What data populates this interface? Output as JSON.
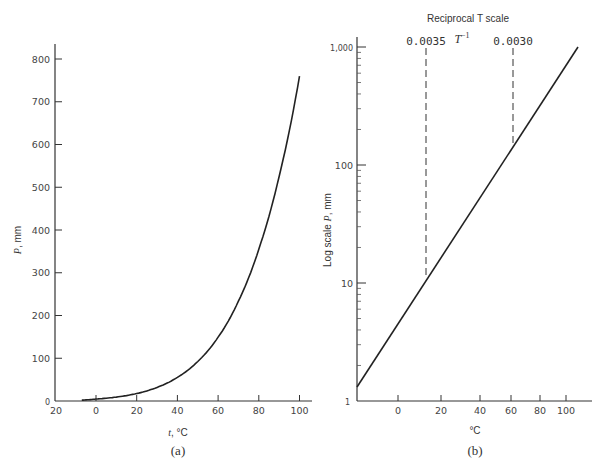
{
  "chart_data": [
    {
      "id": "a",
      "type": "line",
      "caption": "(a)",
      "title": "",
      "xlabel_var": "t",
      "xlabel_unit": ", °C",
      "ylabel_var": "P",
      "ylabel_unit": ", mm",
      "x_ticks": [
        "20",
        "0",
        "20",
        "40",
        "60",
        "80",
        "100"
      ],
      "x_tick_values": [
        -20,
        0,
        20,
        40,
        60,
        80,
        100
      ],
      "y_ticks": [
        "0",
        "100",
        "200",
        "300",
        "400",
        "500",
        "600",
        "700",
        "800"
      ],
      "xlim": [
        -20,
        105
      ],
      "ylim": [
        0,
        850
      ],
      "grid": false,
      "series": [
        {
          "name": "Vapor pressure",
          "x": [
            -7,
            0,
            10,
            20,
            30,
            40,
            50,
            60,
            70,
            80,
            90,
            100
          ],
          "y": [
            2,
            4.6,
            9.2,
            17.5,
            31.8,
            55.3,
            92.5,
            149.4,
            233.7,
            355.1,
            525.8,
            760
          ]
        }
      ]
    },
    {
      "id": "b",
      "type": "line",
      "caption": "(b)",
      "title": "Reciprocal T scale",
      "top_axis_label": "T",
      "top_axis_superscript": "−1",
      "top_ticks": [
        "0.0035",
        "0.0030"
      ],
      "xlabel": "°C",
      "ylabel_prefix": "Log scale ",
      "ylabel_var": "P",
      "ylabel_unit": ", mm",
      "y_scale": "log",
      "y_ticks": [
        "1",
        "10",
        "100",
        "1,000"
      ],
      "x_ticks": [
        "0",
        "20",
        "40",
        "60",
        "80",
        "100"
      ],
      "x_scale": "reciprocal_T",
      "ylim": [
        1,
        1000
      ],
      "grid": false,
      "series": [
        {
          "name": "log P vs 1/T",
          "x": [
            -20,
            0,
            12.6,
            20,
            40,
            60.2,
            80,
            100,
            110
          ],
          "y": [
            1.3,
            4.6,
            11,
            17.5,
            55.3,
            150,
            355.1,
            760,
            1000
          ]
        }
      ],
      "reference_lines": [
        {
          "label": "0.0035",
          "style": "dashed",
          "t_celsius": 12.6
        },
        {
          "label": "0.0030",
          "style": "dashed",
          "t_celsius": 60.2
        }
      ]
    }
  ]
}
